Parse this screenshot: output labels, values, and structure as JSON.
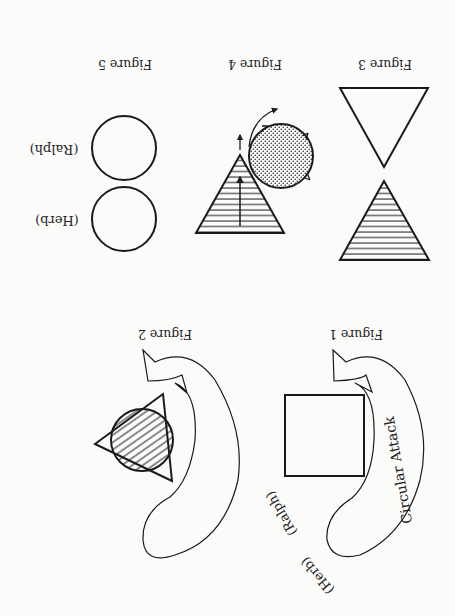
{
  "diagram": {
    "orientation": "rotated 180 degrees",
    "colors": {
      "ink": "#1a1a1a",
      "paper": "#fbfbfa"
    },
    "figures": [
      {
        "id": "figure-1",
        "caption": "Figure 1",
        "arrow_label": "Circular Attack",
        "labels": [
          "(Herb)",
          "(Ralph)"
        ],
        "shapes": [
          "curved-arrow",
          "square"
        ]
      },
      {
        "id": "figure-2",
        "caption": "Figure 2",
        "shapes": [
          "curved-arrow",
          "triangle",
          "hatched-circle"
        ]
      },
      {
        "id": "figure-3",
        "caption": "Figure 3",
        "shapes": [
          "inverted-triangle",
          "hatched-triangle"
        ]
      },
      {
        "id": "figure-4",
        "caption": "Figure 4",
        "shapes": [
          "hatched-triangle",
          "up-arrow",
          "dotted-circle",
          "rotation-arrows"
        ]
      },
      {
        "id": "figure-5",
        "caption": "Figure 5",
        "labels": [
          "(Herb)",
          "(Ralph)"
        ],
        "shapes": [
          "circle",
          "circle"
        ]
      }
    ]
  }
}
